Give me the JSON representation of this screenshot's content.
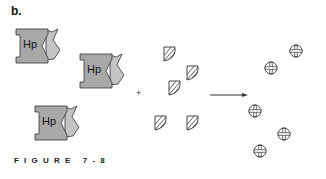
{
  "panel_label": "b.",
  "enzyme_label": "Hp",
  "plus_sign": "+",
  "caption": "FIGURE 7-8",
  "colors": {
    "enzyme_fill": "#a8a8a8",
    "enzyme_notch": "#c4c4c4",
    "stroke": "#333333"
  },
  "enzymes": [
    {
      "x": 14,
      "y": 26
    },
    {
      "x": 78,
      "y": 51
    },
    {
      "x": 33,
      "y": 103
    }
  ],
  "substrates": [
    {
      "x": 162,
      "y": 46
    },
    {
      "x": 185,
      "y": 65
    },
    {
      "x": 167,
      "y": 80
    },
    {
      "x": 153,
      "y": 115
    },
    {
      "x": 185,
      "y": 115
    }
  ],
  "products": [
    {
      "x": 289,
      "y": 44
    },
    {
      "x": 264,
      "y": 61
    },
    {
      "x": 248,
      "y": 104
    },
    {
      "x": 277,
      "y": 127
    },
    {
      "x": 253,
      "y": 144
    }
  ],
  "plus_position": {
    "x": 136,
    "y": 88
  },
  "arrow": {
    "x1": 210,
    "y1": 95,
    "x2": 248,
    "y2": 95
  }
}
